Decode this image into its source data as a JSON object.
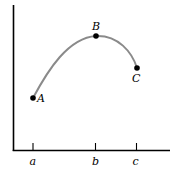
{
  "diagram": {
    "type": "function-curve",
    "colors": {
      "axes": "#000000",
      "curve": "#8a8a8a",
      "points": "#000000",
      "background": "#ffffff"
    },
    "axes": {
      "x_ticks": [
        {
          "label": "a"
        },
        {
          "label": "b"
        },
        {
          "label": "c"
        }
      ]
    },
    "points": [
      {
        "label": "A"
      },
      {
        "label": "B"
      },
      {
        "label": "C"
      }
    ]
  }
}
